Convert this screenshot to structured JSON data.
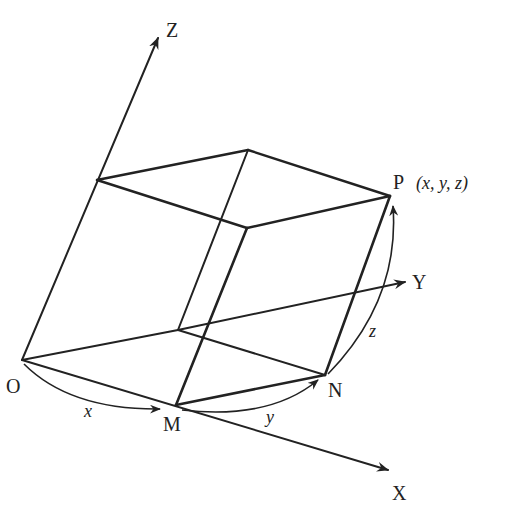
{
  "figure": {
    "header_fragment": "…の座標のとり方を示す図",
    "colors": {
      "stroke": "#222222",
      "background": "#ffffff"
    },
    "axes": {
      "x": {
        "label": "X"
      },
      "y": {
        "label": "Y"
      },
      "z": {
        "label": "Z"
      }
    },
    "points": {
      "origin": "O",
      "m": "M",
      "n": "N",
      "p": "P",
      "p_coords": "(x, y, z)"
    },
    "measures": {
      "x": "x",
      "y": "y",
      "z": "z"
    }
  }
}
